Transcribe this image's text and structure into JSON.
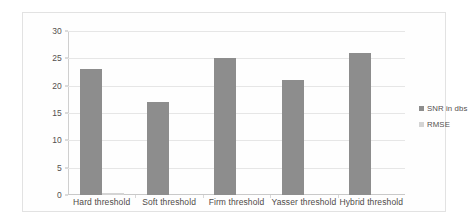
{
  "chart_data": {
    "type": "bar",
    "title": "",
    "subtitle": "",
    "xlabel": "",
    "ylabel": "",
    "categories": [
      "Hard threshold",
      "Soft threshold",
      "Firm threshold",
      "Yasser threshold",
      "Hybrid  threshold"
    ],
    "series": [
      {
        "name": "SNR in dbs",
        "values": [
          23,
          17,
          25,
          21,
          26
        ],
        "color": "#8d8d8d"
      },
      {
        "name": "RMSE",
        "values": [
          0.3,
          0,
          0,
          0,
          0
        ],
        "color": "#d4d4d4"
      }
    ],
    "ylim": [
      0,
      30
    ],
    "ytick_labels": [
      "0",
      "5",
      "10",
      "15",
      "20",
      "25",
      "30"
    ],
    "ytick_values": [
      0,
      5,
      10,
      15,
      20,
      25,
      30
    ],
    "grid": true,
    "grid_orientation": "horizontal",
    "legend_position": "right",
    "legend": [
      {
        "label": "SNR in dbs",
        "color": "#8d8d8d"
      },
      {
        "label": "RMSE",
        "color": "#d4d4d4"
      }
    ]
  }
}
